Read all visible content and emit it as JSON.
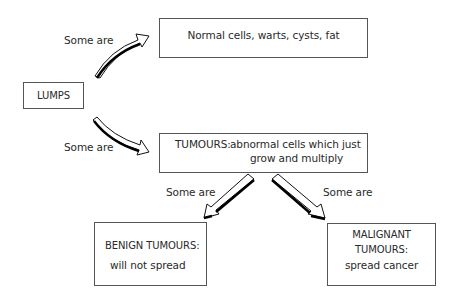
{
  "nodes": {
    "lumps": {
      "label": "LUMPS"
    },
    "normal": {
      "label": "Normal cells, warts, cysts, fat"
    },
    "tumours": {
      "title": "TUMOURS:",
      "line1": "abnormal cells which just",
      "line2": "grow and multiply"
    },
    "benign": {
      "title": "BENIGN TUMOURS:",
      "desc": "will not spread"
    },
    "malignant": {
      "title1": "MALIGNANT",
      "title2": "TUMOURS:",
      "desc": "spread cancer"
    }
  },
  "edges": [
    {
      "from": "lumps",
      "to": "normal",
      "label": "Some are"
    },
    {
      "from": "lumps",
      "to": "tumours",
      "label": "Some are"
    },
    {
      "from": "tumours",
      "to": "benign",
      "label": "Some are"
    },
    {
      "from": "tumours",
      "to": "malignant",
      "label": "Some are"
    }
  ]
}
